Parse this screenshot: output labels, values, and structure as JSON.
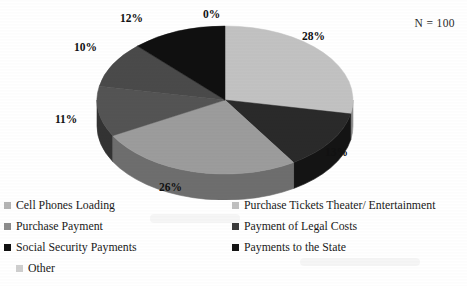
{
  "annotation": {
    "sample_size": "N = 100"
  },
  "chart_data": {
    "type": "pie",
    "title": "",
    "subtitle": "",
    "xlabel": "",
    "ylabel": "",
    "annotation": "N = 100",
    "legend_position": "bottom",
    "grid": false,
    "units": "percent",
    "total": 100,
    "categories": [
      "Cell Phones Loading",
      "Purchase Tickets Theater/ Entertainment",
      "Purchase Payment",
      "Payment of Legal Costs",
      "Social Security Payments",
      "Payments to the State",
      "Other"
    ],
    "values": [
      0,
      28,
      13,
      26,
      11,
      10,
      12
    ],
    "data_labels": [
      "0%",
      "28%",
      "13%",
      "26%",
      "11%",
      "10%",
      "12%"
    ],
    "slices": [
      {
        "label": "Cell Phones Loading",
        "value": 0,
        "data_label": "0%",
        "color": "#bdbdbd",
        "side_color": "#8f8f8f"
      },
      {
        "label": "Purchase Tickets Theater/ Entertainment",
        "value": 28,
        "data_label": "28%",
        "color": "#c2c2c2",
        "side_color": "#919191"
      },
      {
        "label": "Payment of Legal Costs",
        "value": 13,
        "data_label": "13%",
        "color": "#2a2a2a",
        "side_color": "#141414"
      },
      {
        "label": "Purchase Payment",
        "value": 26,
        "data_label": "26%",
        "color": "#9c9c9c",
        "side_color": "#6e6e6e"
      },
      {
        "label": "Social Security Payments",
        "value": 11,
        "data_label": "11%",
        "color": "#545454",
        "side_color": "#333333"
      },
      {
        "label": "Other",
        "value": 10,
        "data_label": "10%",
        "color": "#4a4a4a",
        "side_color": "#2c2c2c"
      },
      {
        "label": "Payments to the State",
        "value": 12,
        "data_label": "12%",
        "color": "#101010",
        "side_color": "#060606"
      }
    ]
  },
  "labels": {
    "p0": "0%",
    "p28": "28%",
    "p13": "13%",
    "p26": "26%",
    "p11": "11%",
    "p10": "10%",
    "p12": "12%"
  },
  "legend": {
    "items": [
      {
        "label": "Cell Phones Loading",
        "color": "#b5b5b5"
      },
      {
        "label": "Purchase Tickets Theater/ Entertainment",
        "color": "#c0c0c0"
      },
      {
        "label": "Purchase Payment",
        "color": "#8d8d8d"
      },
      {
        "label": "Payment of Legal Costs",
        "color": "#3b3b3b"
      },
      {
        "label": "Social Security Payments",
        "color": "#101010"
      },
      {
        "label": "Payments to the State",
        "color": "#141414"
      },
      {
        "label": "Other",
        "color": "#cfcfcf"
      }
    ]
  }
}
